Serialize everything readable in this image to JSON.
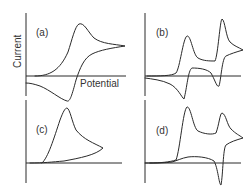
{
  "figure": {
    "y_axis_label": "Current",
    "x_axis_label": "Potential",
    "line_color": "#2a2a2a",
    "panels": [
      {
        "id": "a",
        "label": "(a)",
        "description": "reversible single redox couple voltammogram"
      },
      {
        "id": "b",
        "label": "(b)",
        "description": "two successive reversible redox couples"
      },
      {
        "id": "c",
        "label": "(c)",
        "description": "irreversible oxidation, no return peak"
      },
      {
        "id": "d",
        "label": "(d)",
        "description": "two oxidation peaks, single return reduction peak"
      }
    ]
  }
}
